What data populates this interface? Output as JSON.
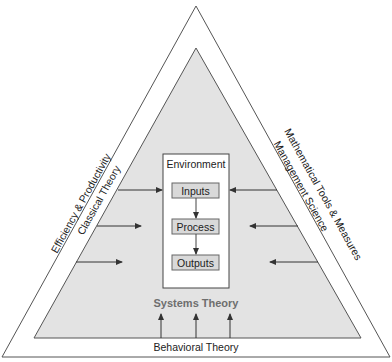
{
  "diagram": {
    "outer_sides": {
      "left": "Efficiency & Productivity",
      "right": "Mathematical Tools & Measures",
      "bottom": "Behavioral Theory"
    },
    "inner_sides": {
      "left": "Classical Theory",
      "right": "Management Science"
    },
    "center_label": "Systems Theory",
    "environment": {
      "title": "Environment",
      "steps": [
        "Inputs",
        "Process",
        "Outputs"
      ]
    },
    "colors": {
      "inner_fill": "#e3e3e3",
      "step_fill": "#d9d9d9",
      "systems_theory_text": "#6e6e6e",
      "line": "#444444"
    }
  }
}
